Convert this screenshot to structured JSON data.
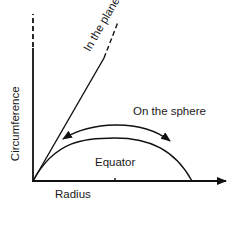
{
  "diagram": {
    "axes": {
      "x_label": "Radius",
      "y_label": "Circumference"
    },
    "curves": {
      "plane_label": "In the plane",
      "sphere_label": "On the sphere",
      "equator_label": "Equator"
    },
    "colors": {
      "line": "#111111",
      "background": "#ffffff"
    }
  }
}
